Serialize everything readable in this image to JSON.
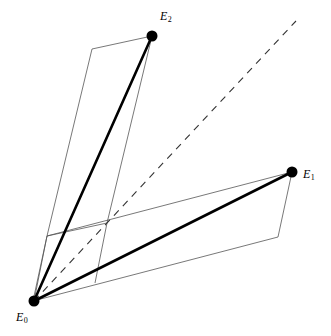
{
  "figure": {
    "title": "",
    "width": 331,
    "height": 336,
    "background_color": "#ffffff",
    "stroke_color": "#000000",
    "thin_stroke_color": "#555555",
    "vertices": [
      {
        "id": "E0",
        "label": "E",
        "subscript": "0",
        "x": 34,
        "y": 301,
        "radius": 5.5,
        "label_x": 16,
        "label_y": 311
      },
      {
        "id": "E1",
        "label": "E",
        "subscript": "1",
        "x": 292,
        "y": 172,
        "radius": 5.5,
        "label_x": 303,
        "label_y": 168
      },
      {
        "id": "E2",
        "label": "E",
        "subscript": "2",
        "x": 152,
        "y": 36,
        "radius": 5.5,
        "label_x": 160,
        "label_y": 10
      }
    ],
    "thick_edges": [
      {
        "name": "edge-E0-E2",
        "from": "E0",
        "to": "E2",
        "x1": 34,
        "y1": 301,
        "x2": 152,
        "y2": 36,
        "width": 2.6
      },
      {
        "name": "edge-E0-E1",
        "from": "E0",
        "to": "E1",
        "x1": 34,
        "y1": 301,
        "x2": 292,
        "y2": 172,
        "width": 2.6
      }
    ],
    "dashed_edge": {
      "name": "dashed-diagonal",
      "x1": 34,
      "y1": 301,
      "x2": 296,
      "y2": 21,
      "width": 1.1,
      "dash": "7 6"
    },
    "parallelograms": [
      {
        "name": "left-parallelogram",
        "points": "47,236 92,49 152,36 107,223",
        "width": 0.8
      },
      {
        "name": "right-parallelogram",
        "points": "47,236 292,172 278,237 33,301",
        "width": 0.8
      }
    ],
    "extra_lines": [
      {
        "name": "left-parallelogram-lower-extension-left",
        "x1": 34,
        "y1": 301,
        "x2": 47,
        "y2": 236,
        "width": 0.8
      },
      {
        "name": "left-parallelogram-lower-extension-right",
        "x1": 95,
        "y1": 283,
        "x2": 107,
        "y2": 223,
        "width": 0.8
      }
    ]
  }
}
